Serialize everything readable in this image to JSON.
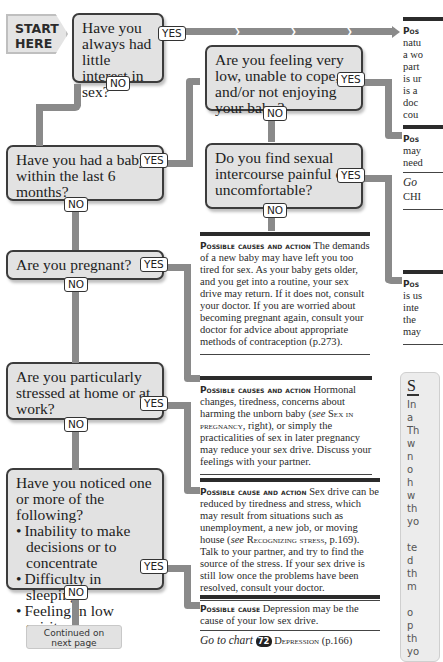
{
  "start": {
    "line1": "START",
    "line2": "HERE"
  },
  "labels": {
    "yes": "YES",
    "no": "NO"
  },
  "questions": [
    {
      "id": "q1",
      "text": "Have you always had little interest in sex?"
    },
    {
      "id": "q2",
      "text": "Have you had a baby within the last 6 months?"
    },
    {
      "id": "q3",
      "text": "Are you feeling very low, unable to cope, and/or not enjoying your baby?"
    },
    {
      "id": "q4",
      "text": "Do you find sexual intercourse painful or uncomfortable?"
    },
    {
      "id": "q5",
      "text": "Are you pregnant?"
    },
    {
      "id": "q6",
      "text": "Are you particularly stressed at home or at work?"
    },
    {
      "id": "q7",
      "intro": "Have you noticed one or more of the following?",
      "bullets": [
        "Inability to make decisions or to concentrate",
        "Difficulty in sleeping",
        "Feeling in low spirits"
      ]
    }
  ],
  "continued": {
    "line1": "Continued on",
    "line2": "next page"
  },
  "panels": {
    "baby": {
      "heading": "Possible causes and action",
      "body": "The demands of a new baby may have left you too tired for sex. As your baby gets older, and you get into a routine, your sex drive may return. If it does not, consult your doctor. If you are worried about becoming pregnant again, consult your doctor for advice about appropriate methods of contraception (p.273)."
    },
    "pregnant": {
      "heading": "Possible causes and action",
      "body_before": "Hormonal changes, tiredness, concerns about harming the unborn baby (",
      "see": "see",
      "ref": "Sex in pregnancy",
      "body_after": ", right), or simply the practicalities of sex in later pregnancy may reduce your sex drive. Discuss your feelings with your partner."
    },
    "stress": {
      "heading": "Possible cause and action",
      "body_before": "Sex drive can be reduced by tiredness and stress, which may result from situations such as unemployment, a new job, or moving house (",
      "see": "see",
      "ref": "Recognizing stress",
      "body_after": ", p.169). Talk to your partner, and try to find the source of the stress. If your sex drive is still low once the problems have been resolved, consult your doctor."
    },
    "depression": {
      "heading": "Possible cause",
      "body": "Depression may be the cause of your low sex drive.",
      "goto_label": "Go to chart",
      "chart_number": "72",
      "chart_name": "Depression",
      "chart_page": "(p.166)"
    },
    "right_top": {
      "heading": "Pos",
      "lines": [
        "natu",
        "a wo",
        "part",
        "is ur",
        "is a",
        "doc",
        "cou"
      ]
    },
    "right_mid": {
      "heading": "Pos",
      "lines": [
        "may",
        "need"
      ],
      "goto": "Go",
      "goto_sub": "CHI"
    },
    "right_low": {
      "heading": "Pos",
      "lines": [
        "is us",
        "inte",
        "the",
        "may"
      ]
    }
  },
  "sidebar": {
    "title": "S",
    "lines": [
      "In",
      "a",
      "Th",
      "w",
      "n",
      "o",
      "h",
      "w",
      "th",
      "yo",
      "",
      "te",
      "d",
      "th",
      "m",
      "",
      "o",
      "p",
      "th",
      "yo"
    ]
  }
}
